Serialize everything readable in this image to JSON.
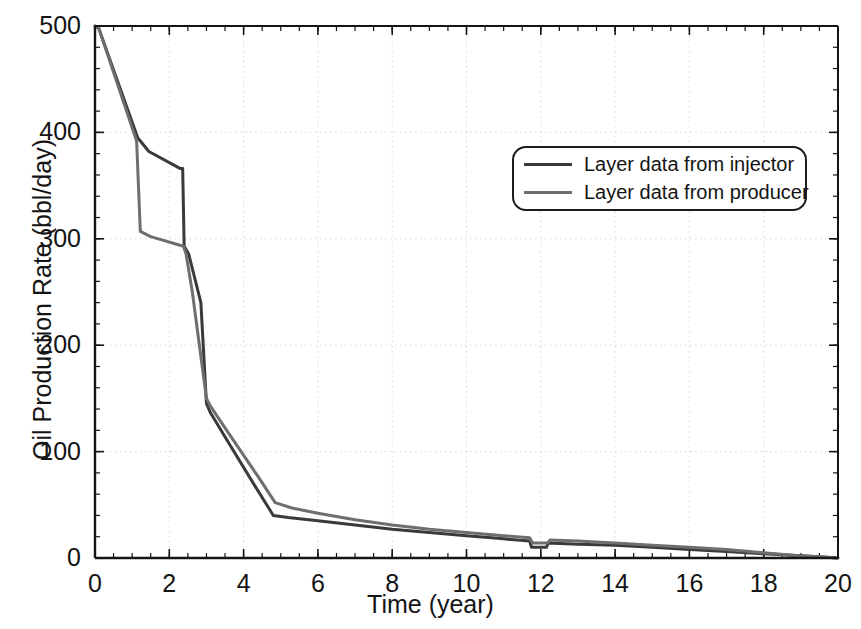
{
  "chart_data": {
    "type": "line",
    "title": "",
    "xlabel": "Time (year)",
    "ylabel": "Oil Production Rate (bbl/day)",
    "xlim": [
      0,
      20
    ],
    "ylim": [
      0,
      500
    ],
    "xticks": [
      0,
      2,
      4,
      6,
      8,
      10,
      12,
      14,
      16,
      18,
      20
    ],
    "yticks": [
      0,
      100,
      200,
      300,
      400,
      500
    ],
    "xtick_labels": [
      "0",
      "2",
      "4",
      "6",
      "8",
      "10",
      "12",
      "14",
      "16",
      "18",
      "20"
    ],
    "ytick_labels": [
      "0",
      "100",
      "200",
      "300",
      "400",
      "500"
    ],
    "x_minor_step": 0.5,
    "y_minor_step": 20,
    "grid": true,
    "grid_style": "dotted",
    "grid_color": "#d8d8d8",
    "legend_position": "upper right",
    "series": [
      {
        "name": "Layer data from injector",
        "color": "#3a3a3a",
        "width": 3.0,
        "points": [
          [
            0.0,
            500
          ],
          [
            0.1,
            498
          ],
          [
            1.15,
            395
          ],
          [
            1.45,
            382
          ],
          [
            2.3,
            366
          ],
          [
            2.36,
            366
          ],
          [
            2.4,
            293
          ],
          [
            2.52,
            286
          ],
          [
            2.85,
            240
          ],
          [
            3.0,
            145
          ],
          [
            3.1,
            137
          ],
          [
            3.6,
            108
          ],
          [
            4.3,
            68
          ],
          [
            4.8,
            40
          ],
          [
            5.2,
            38
          ],
          [
            6.0,
            35
          ],
          [
            7.0,
            31
          ],
          [
            8.0,
            27
          ],
          [
            9.0,
            24
          ],
          [
            10.0,
            21
          ],
          [
            11.0,
            18
          ],
          [
            11.7,
            16
          ],
          [
            11.75,
            10
          ],
          [
            12.15,
            10
          ],
          [
            12.2,
            14
          ],
          [
            13.0,
            13
          ],
          [
            14.0,
            12
          ],
          [
            15.0,
            10
          ],
          [
            16.0,
            8
          ],
          [
            17.0,
            6
          ],
          [
            18.0,
            4
          ],
          [
            19.0,
            2
          ],
          [
            19.6,
            1
          ],
          [
            20.0,
            0
          ]
        ]
      },
      {
        "name": "Layer data from producer",
        "color": "#6e6e6e",
        "width": 3.0,
        "points": [
          [
            0.0,
            500
          ],
          [
            0.1,
            498
          ],
          [
            1.12,
            392
          ],
          [
            1.22,
            307
          ],
          [
            1.5,
            302
          ],
          [
            2.38,
            293
          ],
          [
            2.45,
            286
          ],
          [
            2.62,
            250
          ],
          [
            3.0,
            150
          ],
          [
            3.12,
            142
          ],
          [
            3.7,
            112
          ],
          [
            4.4,
            76
          ],
          [
            4.85,
            52
          ],
          [
            5.3,
            47
          ],
          [
            6.0,
            42
          ],
          [
            7.0,
            36
          ],
          [
            8.0,
            31
          ],
          [
            9.0,
            27
          ],
          [
            10.0,
            24
          ],
          [
            11.0,
            21
          ],
          [
            11.7,
            19
          ],
          [
            11.78,
            14
          ],
          [
            12.18,
            14
          ],
          [
            12.25,
            17
          ],
          [
            13.0,
            16
          ],
          [
            14.0,
            14
          ],
          [
            15.0,
            12
          ],
          [
            16.0,
            10
          ],
          [
            17.0,
            8
          ],
          [
            18.0,
            5
          ],
          [
            19.0,
            2
          ],
          [
            19.6,
            1
          ],
          [
            20.0,
            0
          ]
        ]
      }
    ]
  },
  "axes": {
    "frame_color": "#141414",
    "background": "#ffffff"
  },
  "legend": {
    "items": [
      {
        "label": "Layer data from injector",
        "color": "#3a3a3a"
      },
      {
        "label": "Layer data from producer",
        "color": "#6e6e6e"
      }
    ]
  }
}
